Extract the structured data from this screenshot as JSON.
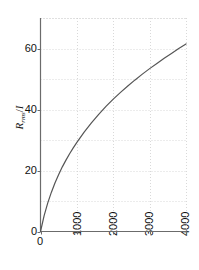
{
  "chart_data": {
    "type": "line",
    "title": "",
    "subtitle": "",
    "xlabel": "",
    "ylabel": "R_rms/I",
    "ylabel_parts": {
      "base": "R",
      "subscript": "rms",
      "separator": "/",
      "denominator": "I"
    },
    "xlim": [
      0,
      4000
    ],
    "ylim": [
      0,
      70
    ],
    "xticks": [
      0,
      1000,
      2000,
      3000,
      4000
    ],
    "xtick_labels": [
      "0",
      "1000",
      "2000",
      "3000",
      "4000"
    ],
    "yticks": [
      0,
      20,
      40,
      60
    ],
    "ytick_labels": [
      "0",
      "20",
      "40",
      "60"
    ],
    "grid": true,
    "grid_x_minor_step": 1000,
    "grid_y_minor_step": 10,
    "legend": null,
    "legend_position": "none",
    "line_color": "#555555",
    "grid_color": "#cfcfcf",
    "axis_color": "#6b6b6b",
    "series": [
      {
        "name": "curve",
        "x": [
          0,
          100,
          200,
          300,
          400,
          500,
          600,
          700,
          800,
          900,
          1000,
          1200,
          1400,
          1600,
          1800,
          2000,
          2200,
          2400,
          2600,
          2800,
          3000,
          3200,
          3400,
          3600,
          3800,
          4000
        ],
        "y": [
          0,
          5.2,
          9.4,
          12.9,
          16.0,
          18.7,
          21.2,
          23.4,
          25.5,
          27.4,
          29.2,
          32.6,
          35.6,
          38.4,
          41.0,
          43.4,
          45.6,
          47.7,
          49.7,
          51.6,
          53.4,
          55.1,
          56.8,
          58.4,
          60.0,
          61.5
        ]
      }
    ]
  },
  "axis_labels": {
    "y_tick_0": "0",
    "y_tick_20": "20",
    "y_tick_40": "40",
    "y_tick_60": "60",
    "x_tick_0": "0",
    "x_tick_1000": "1000",
    "x_tick_2000": "2000",
    "x_tick_3000": "3000",
    "x_tick_4000": "4000"
  }
}
